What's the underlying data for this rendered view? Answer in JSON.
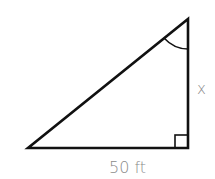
{
  "diagram": {
    "type": "right-triangle",
    "labels": {
      "vertical_side": "x",
      "base": "50 ft"
    },
    "marks": {
      "right_angle": "bottom-right",
      "angle_arc": "top"
    },
    "colors": {
      "stroke": "#111111",
      "label": "#8a8a8a"
    }
  }
}
